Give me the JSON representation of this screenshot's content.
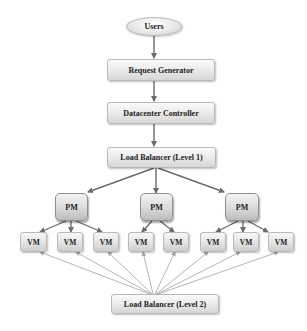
{
  "diagram": {
    "title": "",
    "colors": {
      "arrow": "#6b6b6b",
      "thin_line": "#b5b5b5",
      "node_fill_top": "#fafafa",
      "node_fill_bottom": "#d6d6d6",
      "node_border": "#b9b9b9",
      "text": "#1e1e1e"
    },
    "nodes": {
      "users": {
        "label": "Users",
        "shape": "ellipse"
      },
      "request_generator": {
        "label": "Request Generator",
        "shape": "rounded-rect"
      },
      "datacenter_controller": {
        "label": "Datacenter Controller",
        "shape": "rounded-rect"
      },
      "load_balancer_1": {
        "label": "Load Balancer (Level 1)",
        "shape": "rounded-rect"
      },
      "pms": [
        {
          "label": "PM"
        },
        {
          "label": "PM"
        },
        {
          "label": "PM"
        }
      ],
      "vms": [
        {
          "label": "VM",
          "parent_pm": 0
        },
        {
          "label": "VM",
          "parent_pm": 0
        },
        {
          "label": "VM",
          "parent_pm": 0
        },
        {
          "label": "VM",
          "parent_pm": 1
        },
        {
          "label": "VM",
          "parent_pm": 1
        },
        {
          "label": "VM",
          "parent_pm": 2
        },
        {
          "label": "VM",
          "parent_pm": 2
        },
        {
          "label": "VM",
          "parent_pm": 2
        }
      ],
      "load_balancer_2": {
        "label": "Load Balancer (Level 2)",
        "shape": "rounded-rect"
      }
    },
    "edges": [
      {
        "from": "Users",
        "to": "Request Generator",
        "style": "arrow"
      },
      {
        "from": "Request Generator",
        "to": "Datacenter Controller",
        "style": "arrow"
      },
      {
        "from": "Datacenter Controller",
        "to": "Load Balancer (Level 1)",
        "style": "arrow"
      },
      {
        "from": "Load Balancer (Level 1)",
        "to": "PM 1",
        "style": "arrow"
      },
      {
        "from": "Load Balancer (Level 1)",
        "to": "PM 2",
        "style": "arrow"
      },
      {
        "from": "Load Balancer (Level 1)",
        "to": "PM 3",
        "style": "arrow"
      },
      {
        "from": "PM 1",
        "to": "VM 1",
        "style": "arrow"
      },
      {
        "from": "PM 1",
        "to": "VM 2",
        "style": "arrow"
      },
      {
        "from": "PM 1",
        "to": "VM 3",
        "style": "arrow"
      },
      {
        "from": "PM 2",
        "to": "VM 4",
        "style": "arrow"
      },
      {
        "from": "PM 2",
        "to": "VM 5",
        "style": "arrow"
      },
      {
        "from": "PM 3",
        "to": "VM 6",
        "style": "arrow"
      },
      {
        "from": "PM 3",
        "to": "VM 7",
        "style": "arrow"
      },
      {
        "from": "PM 3",
        "to": "VM 8",
        "style": "arrow"
      },
      {
        "from": "Load Balancer (Level 2)",
        "to": "VM 1..VM 8",
        "style": "thin-line"
      }
    ]
  }
}
